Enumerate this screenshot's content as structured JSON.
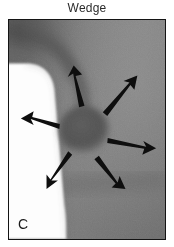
{
  "figure": {
    "title": "Wedge",
    "panel_label": "C",
    "modality": "grayscale-radiograph",
    "border_color": "#141414",
    "page_background": "#ffffff"
  },
  "image": {
    "background_gray": "#7d7d7d",
    "gradient_light_gray": "#8e8e8e",
    "gradient_dark_gray": "#5a5a5a",
    "wedge": {
      "name": "wedge",
      "fill": "#fdfdfd",
      "description": "bright wedge-shaped structure along left margin with rounded superior tip"
    },
    "nodule": {
      "name": "central-nodule",
      "fill": "#4f4f4f",
      "center_x_pct": 48,
      "center_y_pct": 50,
      "radius_x_pct": 16,
      "radius_y_pct": 14,
      "description": "rounded soft-tissue mass at center"
    },
    "curved_band": {
      "name": "curved-band",
      "fill": "#555555",
      "description": "arcing darker band across upper-left region"
    },
    "arrow_color": "#0d0d0d",
    "arrow_count": 6,
    "arrows": [
      {
        "id": "arrow-up",
        "label": "arrow pointing superiorly",
        "angle_deg": 285
      },
      {
        "id": "arrow-upper-right",
        "label": "arrow pointing superolaterally right",
        "angle_deg": 325
      },
      {
        "id": "arrow-right",
        "label": "arrow pointing laterally right",
        "angle_deg": 10
      },
      {
        "id": "arrow-lower-right",
        "label": "arrow pointing inferolaterally right",
        "angle_deg": 65
      },
      {
        "id": "arrow-lower-left",
        "label": "arrow pointing inferolaterally left",
        "angle_deg": 125
      },
      {
        "id": "arrow-left",
        "label": "arrow pointing laterally left",
        "angle_deg": 190
      }
    ]
  }
}
